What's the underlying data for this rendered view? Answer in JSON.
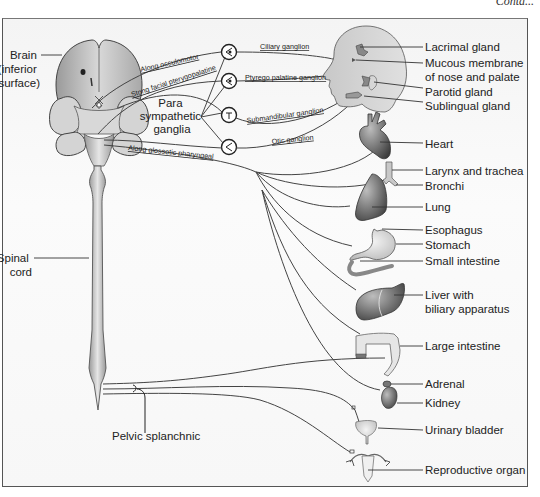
{
  "header": {
    "continuation": "Contd..."
  },
  "diagram": {
    "left_labels": {
      "brain": [
        "Brain",
        "(inferior",
        "surface)"
      ],
      "spinal_cord": [
        "Spinal",
        "cord"
      ],
      "pelvic_splanchnic": "Pelvic splanchnic",
      "para_sympathetic_ganglia": [
        "Para",
        "sympathetic",
        "ganglia"
      ]
    },
    "nerve_labels": {
      "oculomotor": "Along occulomotor",
      "facial": "Stong facial pterygopalatine",
      "glossopharyngeal": "Along glossotic pharyngeal"
    },
    "ganglia": [
      {
        "name": "Ciliary ganglion"
      },
      {
        "name": "Ptyrego palatine ganglion"
      },
      {
        "name": "Submandibular ganglion"
      },
      {
        "name": "Otic ganglion"
      }
    ],
    "organs": [
      {
        "label": [
          "Lacrimal gland"
        ]
      },
      {
        "label": [
          "Mucous membrane",
          "of nose and palate"
        ]
      },
      {
        "label": [
          "Parotid gland"
        ]
      },
      {
        "label": [
          "Sublingual gland"
        ]
      },
      {
        "label": [
          "Heart"
        ]
      },
      {
        "label": [
          "Larynx and trachea"
        ]
      },
      {
        "label": [
          "Bronchi"
        ]
      },
      {
        "label": [
          "Lung"
        ]
      },
      {
        "label": [
          "Esophagus"
        ]
      },
      {
        "label": [
          "Stomach"
        ]
      },
      {
        "label": [
          "Small intestine"
        ]
      },
      {
        "label": [
          "Liver with",
          "biliary apparatus"
        ]
      },
      {
        "label": [
          "Large intestine"
        ]
      },
      {
        "label": [
          "Adrenal"
        ]
      },
      {
        "label": [
          "Kidney"
        ]
      },
      {
        "label": [
          "Urinary bladder"
        ]
      },
      {
        "label": [
          "Reproductive organ"
        ]
      }
    ]
  }
}
